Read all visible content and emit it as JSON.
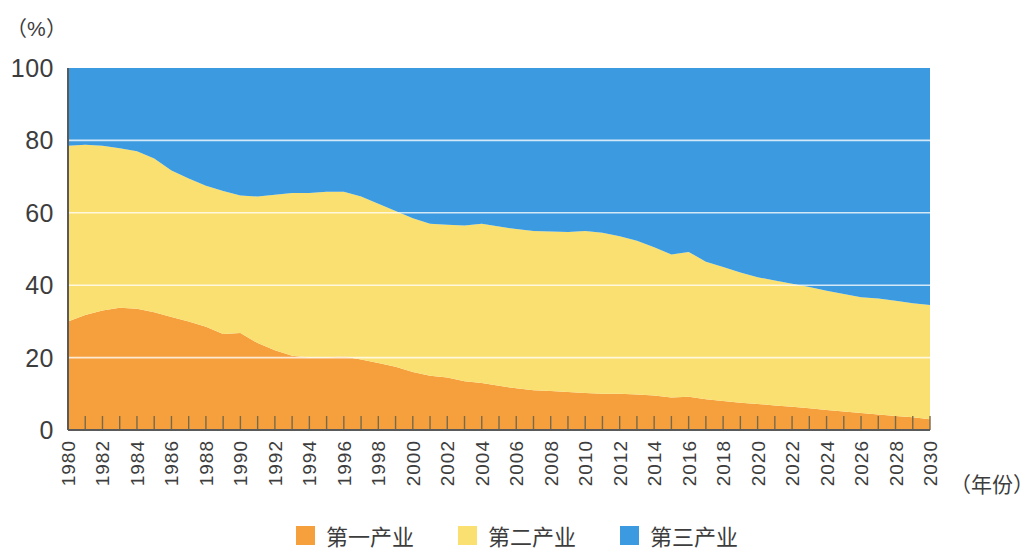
{
  "chart_data": {
    "type": "area",
    "stacked": true,
    "title": "",
    "subtitle": "",
    "xlabel": "（年份）",
    "ylabel": "（%）",
    "ylim": [
      0,
      100
    ],
    "xlim": [
      1980,
      2030
    ],
    "yticks": [
      0,
      20,
      40,
      60,
      80,
      100
    ],
    "grid": true,
    "grid_axis": "y",
    "legend_position": "bottom",
    "x": [
      1980,
      1981,
      1982,
      1983,
      1984,
      1985,
      1986,
      1987,
      1988,
      1989,
      1990,
      1991,
      1992,
      1993,
      1994,
      1995,
      1996,
      1997,
      1998,
      1999,
      2000,
      2001,
      2002,
      2003,
      2004,
      2005,
      2006,
      2007,
      2008,
      2009,
      2010,
      2011,
      2012,
      2013,
      2014,
      2015,
      2016,
      2017,
      2018,
      2019,
      2020,
      2021,
      2022,
      2023,
      2024,
      2025,
      2026,
      2027,
      2028,
      2029,
      2030
    ],
    "xtick_labels": [
      "1980",
      "1982",
      "1984",
      "1986",
      "1988",
      "1990",
      "1992",
      "1994",
      "1996",
      "1998",
      "2000",
      "2002",
      "2004",
      "2006",
      "2008",
      "2010",
      "2012",
      "2014",
      "2016",
      "2018",
      "2020",
      "2022",
      "2024",
      "2026",
      "2028",
      "2030"
    ],
    "series": [
      {
        "name": "第一产业",
        "color": "#F5A03C",
        "values": [
          30.0,
          31.8,
          33.0,
          33.8,
          33.5,
          32.5,
          31.2,
          30.0,
          28.5,
          26.5,
          26.8,
          24.0,
          22.0,
          20.5,
          20.0,
          20.0,
          20.3,
          19.5,
          18.5,
          17.5,
          16.0,
          15.0,
          14.5,
          13.5,
          13.0,
          12.2,
          11.5,
          11.0,
          10.8,
          10.5,
          10.2,
          10.0,
          10.0,
          9.8,
          9.5,
          9.0,
          9.2,
          8.5,
          8.0,
          7.5,
          7.2,
          6.8,
          6.4,
          6.0,
          5.5,
          5.1,
          4.7,
          4.3,
          3.9,
          3.5,
          3.0
        ]
      },
      {
        "name": "第二产业",
        "color": "#FAE070",
        "values": [
          48.5,
          47.0,
          45.5,
          44.0,
          43.5,
          42.5,
          40.5,
          39.5,
          39.0,
          39.5,
          38.0,
          40.5,
          43.0,
          45.0,
          45.5,
          45.8,
          45.5,
          45.0,
          44.0,
          43.0,
          42.5,
          42.0,
          42.2,
          43.0,
          44.0,
          44.0,
          44.0,
          44.0,
          44.0,
          44.2,
          44.8,
          44.5,
          43.5,
          42.5,
          41.0,
          39.5,
          40.0,
          38.0,
          37.0,
          36.0,
          35.0,
          34.5,
          34.0,
          33.5,
          33.0,
          32.5,
          32.0,
          32.0,
          31.8,
          31.5,
          31.5
        ]
      },
      {
        "name": "第三产业",
        "color": "#3C9BE0",
        "values": [
          21.5,
          21.2,
          21.5,
          22.2,
          23.0,
          25.0,
          28.3,
          30.5,
          32.5,
          34.0,
          35.2,
          35.5,
          35.0,
          34.5,
          34.5,
          34.2,
          34.2,
          35.5,
          37.5,
          39.5,
          41.5,
          43.0,
          43.3,
          43.5,
          43.0,
          43.8,
          44.5,
          45.0,
          45.2,
          45.3,
          45.0,
          45.5,
          46.5,
          47.7,
          49.5,
          51.5,
          50.8,
          53.5,
          55.0,
          56.5,
          57.8,
          58.7,
          59.6,
          60.5,
          61.5,
          62.4,
          63.3,
          63.7,
          64.3,
          65.0,
          65.5
        ]
      }
    ]
  },
  "legend": {
    "items": [
      {
        "label": "第一产业",
        "color": "#F5A03C"
      },
      {
        "label": "第二产业",
        "color": "#FAE070"
      },
      {
        "label": "第三产业",
        "color": "#3C9BE0"
      }
    ]
  },
  "axes": {
    "y_unit": "（%）",
    "x_title": "（年份）"
  }
}
